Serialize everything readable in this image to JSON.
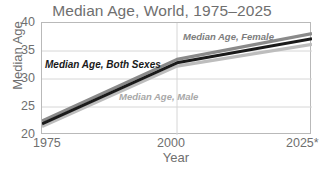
{
  "chart_data": {
    "type": "line",
    "title": "Median Age, World, 1975–2025",
    "xlabel": "Year",
    "ylabel": "Median Age",
    "x": [
      1975,
      2000,
      2025
    ],
    "xtick_labels": [
      "1975",
      "2000",
      "2025*"
    ],
    "ytick_labels": [
      "20",
      "25",
      "30",
      "35",
      "40"
    ],
    "yticks": [
      20,
      25,
      30,
      35,
      40
    ],
    "xlim": [
      1975,
      2025
    ],
    "ylim": [
      20,
      40
    ],
    "grid": "horizontal-gridlines-at-yticks-plus-vertical-at-2000",
    "legend": "inline-labels-on-plot",
    "series": [
      {
        "name": "Median Age, Female",
        "values": [
          22.5,
          33.5,
          38.1
        ],
        "color": "#8a8a8a"
      },
      {
        "name": "Median Age, Both Sexes",
        "values": [
          22.0,
          32.9,
          37.2
        ],
        "color": "#1a1a1a"
      },
      {
        "name": "Median Age, Male",
        "values": [
          21.5,
          32.3,
          36.2
        ],
        "color": "#bdbdbd"
      }
    ]
  },
  "axes": {
    "y_title": "Median Age",
    "x_title": "Year",
    "y_ticks": [
      "40",
      "35",
      "30",
      "25",
      "20"
    ],
    "x_ticks": [
      "1975",
      "2000",
      "2025*"
    ]
  },
  "labels": {
    "female": "Median Age, Female",
    "both_sexes": "Median Age, Both Sexes",
    "male": "Median Age, Male"
  },
  "colors": {
    "female_line": "#8a8a8a",
    "both_sexes_line": "#1a1a1a",
    "male_line": "#bdbdbd",
    "text": "#6f6f6f",
    "frame": "#b9b9b9",
    "gridline": "#d6d6d6"
  }
}
